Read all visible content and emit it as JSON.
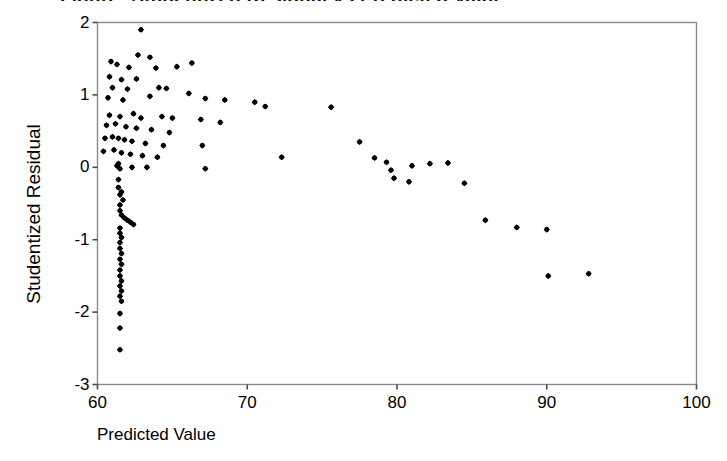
{
  "chart_data": {
    "type": "scatter",
    "title": "Figure: Studentized Residual vs Predicted Value",
    "xlabel": "Predicted Value",
    "ylabel": "Studentized Residual",
    "xlim": [
      60,
      100
    ],
    "ylim": [
      -3,
      2
    ],
    "xticks": [
      60,
      70,
      80,
      90,
      100
    ],
    "yticks": [
      2,
      1,
      0,
      -1,
      -2,
      -3
    ],
    "xticklabels": [
      "60",
      "70",
      "80",
      "90",
      "100"
    ],
    "yticklabels": [
      "2",
      "1",
      "0",
      "-1",
      "-2",
      "-3"
    ],
    "grid": false,
    "legend": null,
    "marker": "filled-diamond",
    "marker_color": "#000000",
    "marker_size": 5,
    "frame": true,
    "points": [
      [
        62.9,
        1.9
      ],
      [
        62.7,
        1.55
      ],
      [
        63.5,
        1.52
      ],
      [
        60.9,
        1.46
      ],
      [
        61.3,
        1.42
      ],
      [
        62.1,
        1.38
      ],
      [
        63.9,
        1.37
      ],
      [
        65.3,
        1.39
      ],
      [
        60.8,
        1.25
      ],
      [
        61.6,
        1.21
      ],
      [
        62.6,
        1.22
      ],
      [
        61.0,
        1.1
      ],
      [
        62.0,
        1.08
      ],
      [
        64.1,
        1.1
      ],
      [
        64.6,
        1.09
      ],
      [
        66.3,
        1.44
      ],
      [
        60.7,
        0.96
      ],
      [
        61.7,
        0.93
      ],
      [
        63.5,
        0.98
      ],
      [
        66.1,
        1.02
      ],
      [
        67.2,
        0.95
      ],
      [
        68.5,
        0.93
      ],
      [
        70.5,
        0.9
      ],
      [
        71.2,
        0.84
      ],
      [
        75.6,
        0.83
      ],
      [
        60.8,
        0.72
      ],
      [
        61.5,
        0.7
      ],
      [
        62.4,
        0.74
      ],
      [
        62.9,
        0.68
      ],
      [
        64.3,
        0.7
      ],
      [
        65.0,
        0.68
      ],
      [
        66.9,
        0.66
      ],
      [
        68.2,
        0.62
      ],
      [
        60.6,
        0.58
      ],
      [
        61.2,
        0.6
      ],
      [
        61.9,
        0.56
      ],
      [
        62.6,
        0.54
      ],
      [
        63.6,
        0.52
      ],
      [
        64.8,
        0.48
      ],
      [
        60.5,
        0.4
      ],
      [
        61.0,
        0.42
      ],
      [
        61.4,
        0.4
      ],
      [
        61.8,
        0.38
      ],
      [
        62.3,
        0.36
      ],
      [
        63.2,
        0.33
      ],
      [
        64.4,
        0.3
      ],
      [
        67.0,
        0.3
      ],
      [
        77.5,
        0.35
      ],
      [
        60.4,
        0.22
      ],
      [
        61.1,
        0.24
      ],
      [
        61.6,
        0.2
      ],
      [
        62.2,
        0.18
      ],
      [
        63.0,
        0.16
      ],
      [
        64.0,
        0.14
      ],
      [
        72.3,
        0.14
      ],
      [
        78.5,
        0.13
      ],
      [
        79.3,
        0.07
      ],
      [
        79.6,
        -0.04
      ],
      [
        79.8,
        -0.15
      ],
      [
        81.0,
        0.02
      ],
      [
        82.2,
        0.05
      ],
      [
        83.4,
        0.06
      ],
      [
        61.4,
        0.05
      ],
      [
        61.3,
        0.02
      ],
      [
        61.5,
        -0.02
      ],
      [
        62.3,
        0.0
      ],
      [
        63.3,
        0.0
      ],
      [
        67.2,
        -0.02
      ],
      [
        80.8,
        -0.2
      ],
      [
        84.5,
        -0.22
      ],
      [
        61.4,
        -0.17
      ],
      [
        61.4,
        -0.28
      ],
      [
        61.6,
        -0.34
      ],
      [
        61.5,
        -0.38
      ],
      [
        61.7,
        -0.45
      ],
      [
        61.5,
        -0.52
      ],
      [
        61.5,
        -0.6
      ],
      [
        61.6,
        -0.66
      ],
      [
        61.8,
        -0.7
      ],
      [
        62.0,
        -0.73
      ],
      [
        62.2,
        -0.76
      ],
      [
        62.4,
        -0.79
      ],
      [
        61.5,
        -0.84
      ],
      [
        61.5,
        -0.91
      ],
      [
        61.6,
        -0.97
      ],
      [
        61.5,
        -1.04
      ],
      [
        61.5,
        -1.12
      ],
      [
        61.6,
        -1.19
      ],
      [
        61.5,
        -1.27
      ],
      [
        61.6,
        -1.34
      ],
      [
        61.5,
        -1.42
      ],
      [
        61.5,
        -1.5
      ],
      [
        61.6,
        -1.57
      ],
      [
        61.5,
        -1.64
      ],
      [
        61.6,
        -1.71
      ],
      [
        61.5,
        -1.78
      ],
      [
        61.6,
        -1.85
      ],
      [
        61.5,
        -2.02
      ],
      [
        61.5,
        -2.22
      ],
      [
        61.5,
        -2.52
      ],
      [
        85.9,
        -0.73
      ],
      [
        88.0,
        -0.83
      ],
      [
        90.0,
        -0.86
      ],
      [
        90.1,
        -1.5
      ],
      [
        92.8,
        -1.47
      ]
    ]
  }
}
